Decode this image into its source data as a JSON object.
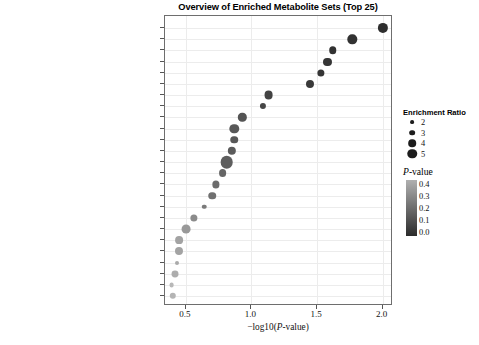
{
  "chart_data": {
    "type": "scatter",
    "title": "Overview of Enriched Metabolite Sets (Top 25)",
    "xlabel": "−log10(P-value)",
    "ylabel": "",
    "xlim": [
      0.34,
      2.08
    ],
    "xticks": [
      0.5,
      1.0,
      1.5,
      2.0
    ],
    "xticklabels": [
      "0.5",
      "1.0",
      "1.5",
      "2.0"
    ],
    "grid": true,
    "legend_position": "right",
    "categories": [
      "Alpha Linolenic Acid and Linoleic Acid Metabolism",
      "Carnitine Synthesis",
      "Glycerolipid Metabolism",
      "Glycolysis",
      "Oxidation of Branched Chain Fatty Acids",
      "Arginine and Proline Metabolism",
      "Betaine Metabolism",
      "Gluconeogenesis",
      "Warburg Effect",
      "Phosphatidylcholine Biosynthesis",
      "Methionine Metabolism",
      "Phospholipid Biosynthesis",
      "Methylhistidine Metabolism",
      "Beta Oxidation of Very Long Chain Fatty Acids",
      "Spermidine and Spermine Biosynthesis",
      "Mitochondrial Electron Transport Chain",
      "Purine Metabolism",
      "Transfer of Acetyl Groups into Mitochondria",
      "Biotin Metabolism",
      "Lactose Degradation",
      "De Novo Triacylglycerol Biosynthesis",
      "Bile Acid Biosynthesis",
      "Malate-Aspartate Shuttle",
      "Urea Cycle",
      "Glycerol Phosphate Shuttle"
    ],
    "x": [
      2.0,
      1.77,
      1.62,
      1.58,
      1.53,
      1.45,
      1.13,
      1.09,
      0.93,
      0.87,
      0.87,
      0.85,
      0.81,
      0.78,
      0.73,
      0.7,
      0.64,
      0.56,
      0.5,
      0.45,
      0.45,
      0.43,
      0.42,
      0.39,
      0.4
    ],
    "enrichment_ratio": [
      4.1,
      3.8,
      3.1,
      3.3,
      3.0,
      3.3,
      3.6,
      2.6,
      3.4,
      3.8,
      3.1,
      3.4,
      5.0,
      3.2,
      3.0,
      3.1,
      2.0,
      3.0,
      3.6,
      3.2,
      3.3,
      1.8,
      2.9,
      2.1,
      2.7
    ],
    "p_value": [
      0.01,
      0.02,
      0.02,
      0.03,
      0.03,
      0.04,
      0.07,
      0.08,
      0.12,
      0.13,
      0.13,
      0.14,
      0.15,
      0.17,
      0.19,
      0.2,
      0.23,
      0.28,
      0.32,
      0.35,
      0.35,
      0.37,
      0.38,
      0.41,
      0.4
    ]
  },
  "legends": {
    "size": {
      "title": "Enrichment Ratio",
      "values": [
        "2",
        "3",
        "4",
        "5"
      ]
    },
    "color": {
      "title_prefix": "P",
      "title_suffix": "-value",
      "ticks": [
        "0.4",
        "0.3",
        "0.2",
        "0.1",
        "0.0"
      ],
      "high_color": "#b0b0b0",
      "low_color": "#2b2b2b"
    }
  },
  "axis": {
    "xtitle_prefix": "−log10(",
    "xtitle_italic": "P",
    "xtitle_suffix": "-value)"
  }
}
